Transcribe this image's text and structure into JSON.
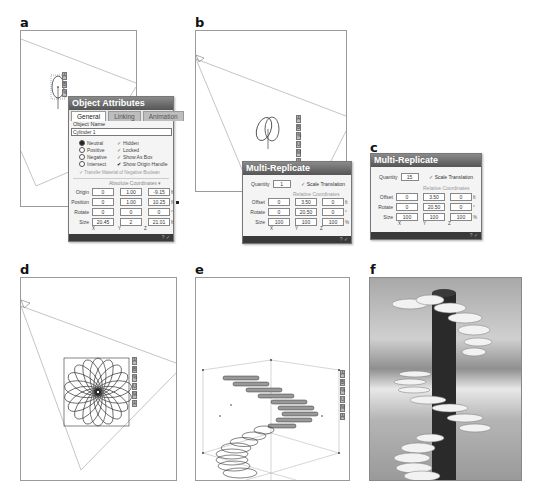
{
  "panels": {
    "a": {
      "label": "a"
    },
    "b": {
      "label": "b"
    },
    "c": {
      "label": "c"
    },
    "d": {
      "label": "d"
    },
    "e": {
      "label": "e"
    },
    "f": {
      "label": "f"
    }
  },
  "side_buttons": [
    "A",
    "B",
    "%",
    "U",
    "M",
    "A"
  ],
  "object_attributes": {
    "title": "Object Attributes",
    "tabs": [
      "General",
      "Linking",
      "Animation"
    ],
    "object_name_label": "Object Name",
    "object_name_value": "Cylinder 1",
    "options_left": [
      {
        "label": "Neutral",
        "selected": true
      },
      {
        "label": "Positive",
        "selected": false
      },
      {
        "label": "Negative",
        "selected": false
      },
      {
        "label": "Intersect",
        "selected": false
      }
    ],
    "options_right": [
      {
        "label": "Hidden",
        "checked": false
      },
      {
        "label": "Locked",
        "checked": false
      },
      {
        "label": "Show As Box",
        "checked": false
      },
      {
        "label": "Show Origin Handle",
        "checked": true
      }
    ],
    "transfer_label": "Transfer Material of Negative Boolean",
    "coords_header": "Absolute Coordinates",
    "rows": [
      {
        "label": "Origin",
        "x": "0",
        "y": "1.00",
        "z": "-9.15",
        "unit": "ft"
      },
      {
        "label": "Position",
        "x": "0",
        "y": "1.00",
        "z": "10.25",
        "unit": "ft"
      },
      {
        "label": "Rotate",
        "x": "0",
        "y": "0",
        "z": "0",
        "unit": "°"
      },
      {
        "label": "Size",
        "x": "20.45",
        "y": "2",
        "z": "21.01",
        "unit": "ft"
      }
    ],
    "axes": [
      "X",
      "Y",
      "Z"
    ]
  },
  "multi_replicate_b": {
    "title": "Multi-Replicate",
    "quantity_label": "Quantity",
    "quantity_value": "1",
    "scale_translation_label": "Scale Translation",
    "coords_header": "Relative Coordinates",
    "rows": [
      {
        "label": "Offset",
        "x": "0",
        "y": "3.50",
        "z": "0",
        "unit": "ft"
      },
      {
        "label": "Rotate",
        "x": "0",
        "y": "20.50",
        "z": "0",
        "unit": "°"
      },
      {
        "label": "Size",
        "x": "100",
        "y": "100",
        "z": "100",
        "unit": "%"
      }
    ],
    "axes": [
      "X",
      "Y",
      "Z"
    ]
  },
  "multi_replicate_c": {
    "title": "Multi-Replicate",
    "quantity_label": "Quantity",
    "quantity_value": "15",
    "scale_translation_label": "Scale Translation",
    "coords_header": "Relative Coordinates",
    "rows": [
      {
        "label": "Offset",
        "x": "0",
        "y": "3.50",
        "z": "0",
        "unit": "ft"
      },
      {
        "label": "Rotate",
        "x": "0",
        "y": "20.50",
        "z": "0",
        "unit": "°"
      },
      {
        "label": "Size",
        "x": "100",
        "y": "100",
        "z": "100",
        "unit": "%"
      }
    ],
    "axes": [
      "X",
      "Y",
      "Z"
    ]
  },
  "footer_icons": "? ✓"
}
